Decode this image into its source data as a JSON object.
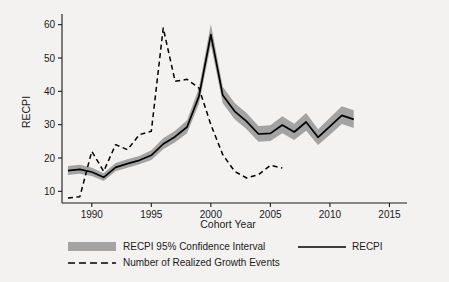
{
  "chart_data": {
    "type": "line",
    "title": "",
    "xlabel": "Cohort Year",
    "ylabel": "RECPI",
    "xlim": [
      1987.5,
      2015.8
    ],
    "ylim": [
      6.5,
      62
    ],
    "grid": false,
    "legend_position": "below-axes",
    "xticks": [
      "1990",
      "1995",
      "2000",
      "2005",
      "2010",
      "2015"
    ],
    "xtick_values": [
      1990,
      1995,
      2000,
      2005,
      2010,
      2015
    ],
    "yticks": [
      "10",
      "20",
      "30",
      "40",
      "50",
      "60"
    ],
    "ytick_values": [
      10,
      20,
      30,
      40,
      50,
      60
    ],
    "x": [
      1988,
      1989,
      1990,
      1991,
      1992,
      1993,
      1994,
      1995,
      1996,
      1997,
      1998,
      1999,
      2000,
      2001,
      2002,
      2003,
      2004,
      2005,
      2006,
      2007,
      2008,
      2009,
      2010,
      2011,
      2012
    ],
    "series": [
      {
        "name": "RECPI",
        "style": "solid",
        "color": "#000000",
        "values": [
          16.2,
          16.6,
          15.8,
          14.2,
          17.2,
          18.3,
          19.3,
          20.8,
          24.2,
          26.4,
          29.3,
          38.5,
          57.0,
          38.8,
          34.0,
          31.0,
          27.2,
          27.4,
          29.9,
          27.8,
          30.8,
          26.2,
          29.5,
          32.8,
          31.6
        ]
      },
      {
        "name": "RECPI 95% Confidence Interval",
        "style": "band",
        "color": "#a3a3a3",
        "lower": [
          14.9,
          15.3,
          14.6,
          13.1,
          16.0,
          17.1,
          18.1,
          19.4,
          22.6,
          24.7,
          27.4,
          36.2,
          54.0,
          36.4,
          31.6,
          28.6,
          24.9,
          25.1,
          27.4,
          25.4,
          28.2,
          23.9,
          27.0,
          30.2,
          29.0
        ],
        "upper": [
          17.6,
          18.0,
          17.1,
          15.4,
          18.5,
          19.6,
          20.6,
          22.3,
          25.9,
          28.2,
          31.3,
          41.0,
          60.2,
          41.4,
          36.5,
          33.5,
          29.6,
          29.8,
          32.5,
          30.3,
          33.5,
          28.6,
          32.1,
          35.5,
          34.3
        ]
      },
      {
        "name": "Number of Realized Growth Events",
        "style": "dashed",
        "color": "#000000",
        "x": [
          1988,
          1989,
          1990,
          1991,
          1992,
          1993,
          1994,
          1995,
          1996,
          1997,
          1998,
          1999,
          2000,
          2001,
          2002,
          2003,
          2004,
          2005,
          2006
        ],
        "values": [
          8,
          8.4,
          22,
          16,
          24,
          22.5,
          27,
          28,
          59,
          43,
          43.6,
          41,
          30,
          21,
          16,
          14,
          15,
          17.8,
          17
        ]
      }
    ]
  },
  "legend": {
    "items": [
      {
        "label": "RECPI 95% Confidence Interval",
        "marker": "band"
      },
      {
        "label": "RECPI",
        "marker": "solid"
      },
      {
        "label": "Number of Realized Growth Events",
        "marker": "dashed"
      }
    ]
  },
  "colors": {
    "background": "#f4f2f1",
    "axis": "#1a1a1a",
    "band": "#a3a3a3",
    "line": "#000000"
  }
}
